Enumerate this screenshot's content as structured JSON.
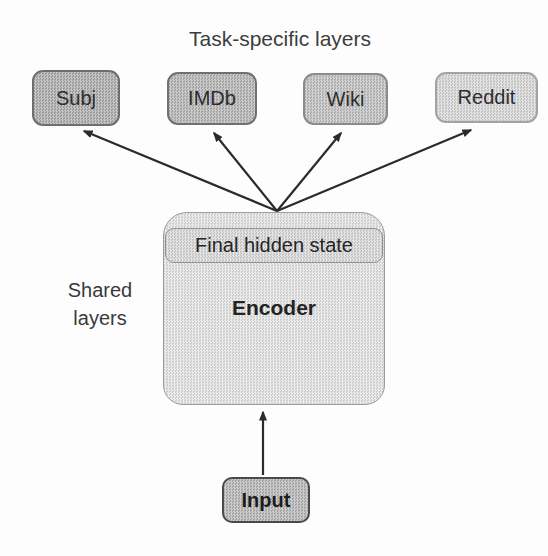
{
  "title": "Task-specific layers",
  "labels": {
    "shared": "Shared\nlayers"
  },
  "task_boxes": [
    {
      "label": "Subj",
      "fill": "#aaaaaa",
      "border": "#6e6e6e"
    },
    {
      "label": "IMDb",
      "fill": "#b3b3b3",
      "border": "#707070"
    },
    {
      "label": "Wiki",
      "fill": "#bfbfbf",
      "border": "#8b8b8b"
    },
    {
      "label": "Reddit",
      "fill": "#d7d7d7",
      "border": "#a3a3a3"
    }
  ],
  "encoder": {
    "header_label": "Final hidden state",
    "label": "Encoder",
    "fill": "#e4e4e4",
    "border": "#9c9c9c",
    "header_fill": "#d9d9d9",
    "header_border": "#8f8f8f"
  },
  "input": {
    "label": "Input",
    "fill": "#b5b5b5",
    "border": "#4a4a4a"
  },
  "edges": [
    {
      "from": "Encoder",
      "to": "Subj"
    },
    {
      "from": "Encoder",
      "to": "IMDb"
    },
    {
      "from": "Encoder",
      "to": "Wiki"
    },
    {
      "from": "Encoder",
      "to": "Reddit"
    },
    {
      "from": "Input",
      "to": "Encoder"
    }
  ],
  "colors": {
    "arrow": "#2b2b2b",
    "canvas_background": "#fdfdfd",
    "text": "#333333"
  }
}
